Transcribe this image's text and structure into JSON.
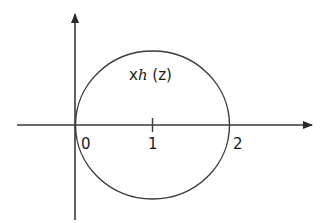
{
  "diagram": {
    "curve_label": {
      "prefix": "x",
      "func": "h",
      "arg": " (z)"
    },
    "axis_ticks": [
      {
        "label": "0",
        "value": 0
      },
      {
        "label": "1",
        "value": 1
      },
      {
        "label": "2",
        "value": 2
      }
    ],
    "circle": {
      "center": 1,
      "radius": 1
    },
    "colors": {
      "stroke": "#3a3a3a",
      "text": "#1a1a1a",
      "background": "#ffffff"
    }
  }
}
